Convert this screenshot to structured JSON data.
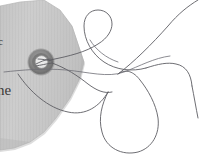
{
  "image": {
    "title": "Torn paper tag with metal grommet and thread",
    "width": 200,
    "height": 166,
    "background_color": "#ffffff"
  },
  "paper": {
    "name": "torn-paper-scrap",
    "fill_color": "#c9c9c9",
    "edge_color": "#b2b2b2",
    "shadow_color": "#9a9a9a",
    "texture": "vertical-fiber-lines",
    "printed_text": {
      "line_fragment_upper": "c",
      "line_fragment_lower": "ne"
    }
  },
  "grommet": {
    "name": "metal-grommet",
    "outer_color": "#8b8b8b",
    "rim_color": "#6e6e6e",
    "hole_color": "#e8e8e8",
    "center_x": 41,
    "center_y": 62,
    "outer_radius": 13,
    "hole_radius": 6
  },
  "thread": {
    "name": "thread-string",
    "color": "#5d5d63",
    "stroke_width": 0.9,
    "description": "thin dark thread passing through the grommet and looping in large curves across the white background"
  },
  "labels": {
    "scene": "torn-paper-scene",
    "paper_layer": "paper-layer",
    "thread_layer": "thread-layer"
  }
}
